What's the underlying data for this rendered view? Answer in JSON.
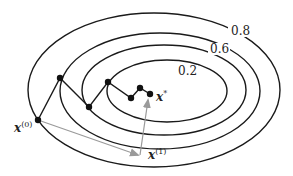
{
  "diagram": {
    "contour_labels": [
      "0.8",
      "0.6",
      "0.2"
    ],
    "point_labels": {
      "start": {
        "base": "x",
        "sup": "(0)"
      },
      "step1": {
        "base": "x",
        "sup": "(1)"
      },
      "optimum": {
        "base": "x",
        "sup": "*"
      }
    },
    "colors": {
      "contour": "#1a1a1a",
      "path": "#1a1a1a",
      "arrow": "#9a9a9a",
      "point": "#111111"
    }
  }
}
